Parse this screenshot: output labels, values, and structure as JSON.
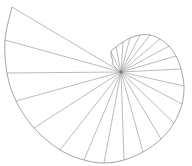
{
  "diagram": {
    "title": "",
    "type": "spiral-rays",
    "center": [
      121,
      72
    ],
    "colors": {
      "line": "#a9a9a9",
      "background": "#ffffff"
    },
    "endpoints": [
      [
        111,
        52
      ],
      [
        116,
        47
      ],
      [
        123,
        42
      ],
      [
        130,
        38
      ],
      [
        140,
        35
      ],
      [
        150,
        35
      ],
      [
        160,
        39
      ],
      [
        169,
        46
      ],
      [
        176,
        56
      ],
      [
        181,
        69
      ],
      [
        184,
        86
      ],
      [
        182,
        104
      ],
      [
        174,
        123
      ],
      [
        161,
        139
      ],
      [
        143,
        152
      ],
      [
        124,
        160
      ],
      [
        104,
        163
      ],
      [
        84,
        160
      ],
      [
        60,
        150
      ],
      [
        34,
        128
      ],
      [
        16,
        101
      ],
      [
        7,
        73
      ],
      [
        5,
        40
      ],
      [
        12,
        7
      ]
    ]
  }
}
